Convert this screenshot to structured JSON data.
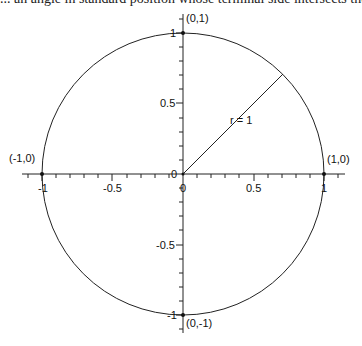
{
  "header_text_cut": "... an angle in standard position whose terminal side intersects the unit circle at P and the equ...",
  "diagram": {
    "title": "Unit circle",
    "radius_label": "r = 1",
    "points": [
      {
        "label": "(0,1)",
        "x": 0,
        "y": 1
      },
      {
        "label": "(-1,0)",
        "x": -1,
        "y": 0
      },
      {
        "label": "(1,0)",
        "x": 1,
        "y": 0
      },
      {
        "label": "(0,-1)",
        "x": 0,
        "y": -1
      }
    ],
    "x_ticks": [
      "-1",
      "-0.5",
      "0",
      "0.5",
      "1"
    ],
    "y_ticks": [
      "1",
      "0.5",
      "0",
      "-0.5",
      "-1"
    ],
    "colors": {
      "stroke": "#222222",
      "text": "#111111",
      "background": "#ffffff"
    }
  }
}
